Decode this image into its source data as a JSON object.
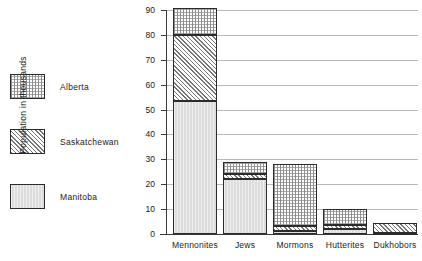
{
  "legend": {
    "items": [
      {
        "label": "Alberta",
        "swatch": "dotted-stipple",
        "color": "#8d8d8d"
      },
      {
        "label": "Saskatchewan",
        "swatch": "diagonal-hatch",
        "color": "#767676"
      },
      {
        "label": "Manitoba",
        "swatch": "solid-light-grey",
        "color": "#dcdcdc"
      }
    ]
  },
  "chart_data": {
    "type": "bar",
    "title": "",
    "subtitle": "",
    "xlabel": "",
    "ylabel": "Population in thousands",
    "stacked": true,
    "grid": true,
    "legend_position": "left",
    "ylim": [
      0,
      90
    ],
    "ytick_labels": [
      "0",
      "10",
      "20",
      "30",
      "40",
      "50",
      "60",
      "70",
      "80",
      "90"
    ],
    "yticks": [
      0,
      10,
      20,
      30,
      40,
      50,
      60,
      70,
      80,
      90
    ],
    "categories": [
      "Mennonites",
      "Jews",
      "Mormons",
      "Hutterites",
      "Dukhobors"
    ],
    "series": [
      {
        "name": "Manitoba",
        "fill": "manitoba",
        "values": [
          53.5,
          22.0,
          1.0,
          2.0,
          0.5
        ]
      },
      {
        "name": "Saskatchewan",
        "fill": "saskatchewan",
        "values": [
          26.5,
          2.0,
          2.0,
          1.5,
          4.0
        ]
      },
      {
        "name": "Alberta",
        "fill": "alberta",
        "values": [
          11.0,
          5.0,
          25.0,
          6.5,
          0.0
        ]
      }
    ],
    "totals": [
      91.0,
      29.0,
      28.0,
      10.0,
      4.5
    ]
  }
}
